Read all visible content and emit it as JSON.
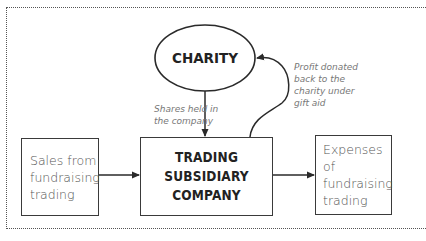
{
  "diagram": {
    "type": "flow",
    "nodes": {
      "charity": {
        "label": "CHARITY",
        "shape": "ellipse"
      },
      "subsidiary": {
        "label_lines": [
          "TRADING SUBSIDIARY",
          "COMPANY"
        ],
        "shape": "rectangle"
      },
      "sales": {
        "label_lines": [
          "Sales from",
          "fundraising",
          "trading"
        ],
        "shape": "rectangle"
      },
      "expenses": {
        "label_lines": [
          "Expenses of",
          "fundraising",
          "trading"
        ],
        "shape": "rectangle"
      }
    },
    "edges": [
      {
        "from": "charity",
        "to": "subsidiary",
        "label_lines": [
          "Shares held in",
          "the company"
        ]
      },
      {
        "from": "subsidiary",
        "to": "charity",
        "label_lines": [
          "Profit donated",
          "back to the",
          "charity under",
          "gift aid"
        ]
      },
      {
        "from": "sales",
        "to": "subsidiary",
        "label_lines": []
      },
      {
        "from": "subsidiary",
        "to": "expenses",
        "label_lines": []
      }
    ],
    "colors": {
      "stroke": "#3a3a3a",
      "node_text": "#222222",
      "note_text": "#777777",
      "frame": "#555555"
    }
  }
}
